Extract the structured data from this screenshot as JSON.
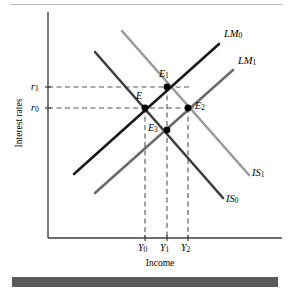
{
  "figure": {
    "type": "diagram",
    "subtype": "is-lm-macroeconomic-diagram",
    "axes": {
      "y_title": "Interest rates",
      "x_title": "Income",
      "y_ticks": [
        {
          "id": "r1",
          "label": "r",
          "sub": "1",
          "y_px": 87
        },
        {
          "id": "r0",
          "label": "r",
          "sub": "0",
          "y_px": 108
        }
      ],
      "x_ticks": [
        {
          "id": "Y0",
          "label": "Y",
          "sub": "0",
          "x_px": 145
        },
        {
          "id": "Y1",
          "label": "Y",
          "sub": "1",
          "x_px": 167
        },
        {
          "id": "Y2",
          "label": "Y",
          "sub": "2",
          "x_px": 188
        }
      ],
      "origin_px": {
        "x": 48,
        "y": 238
      },
      "y_axis_top_px": 12,
      "x_axis_right_px": 282
    },
    "curves": [
      {
        "id": "LM0",
        "label": "LM",
        "sub": "0",
        "color": "#1a1a1a",
        "slope": "upward",
        "x1": 74,
        "y1": 174,
        "x2": 219,
        "y2": 44,
        "label_x": 224,
        "label_y": 30
      },
      {
        "id": "LM1",
        "label": "LM",
        "sub": "1",
        "color": "#6b6b6b",
        "slope": "upward",
        "x1": 95,
        "y1": 193,
        "x2": 233,
        "y2": 70,
        "label_x": 238,
        "label_y": 56
      },
      {
        "id": "IS0",
        "label": "IS",
        "sub": "0",
        "color": "#3d3d3d",
        "slope": "downward",
        "x1": 95,
        "y1": 52,
        "x2": 223,
        "y2": 198,
        "label_x": 226,
        "label_y": 196
      },
      {
        "id": "IS1",
        "label": "IS",
        "sub": "1",
        "color": "#9a9a9a",
        "slope": "downward",
        "x1": 122,
        "y1": 31,
        "x2": 249,
        "y2": 175,
        "label_x": 252,
        "label_y": 170
      }
    ],
    "points": [
      {
        "id": "E",
        "label": "E",
        "sub": "",
        "x": 145,
        "y": 108,
        "label_x": 136,
        "label_y": 93
      },
      {
        "id": "E1",
        "label": "E",
        "sub": "1",
        "x": 167,
        "y": 87,
        "label_x": 159,
        "label_y": 71
      },
      {
        "id": "E2",
        "label": "E",
        "sub": "2",
        "x": 188,
        "y": 108,
        "label_x": 196,
        "label_y": 101
      },
      {
        "id": "E3",
        "label": "E",
        "sub": "3",
        "x": 167,
        "y": 130,
        "label_x": 149,
        "label_y": 124
      }
    ],
    "guides": {
      "horizontal": [
        {
          "for": "r1",
          "y": 87,
          "x_from": 48,
          "x_to": 190
        },
        {
          "for": "r0",
          "y": 108,
          "x_from": 48,
          "x_to": 194
        }
      ],
      "vertical": [
        {
          "for": "Y0",
          "x": 145,
          "y_from": 108,
          "y_to": 238
        },
        {
          "for": "Y1",
          "x": 167,
          "y_from": 87,
          "y_to": 238
        },
        {
          "for": "Y2",
          "x": 188,
          "y_from": 108,
          "y_to": 238
        }
      ],
      "dash_color": "#555555"
    },
    "style": {
      "axis_color": "#3f3f3f",
      "top_rule_color": "#b9b9b9",
      "bottom_bar_color": "#5a5a5a",
      "background": "#ffffff"
    }
  }
}
